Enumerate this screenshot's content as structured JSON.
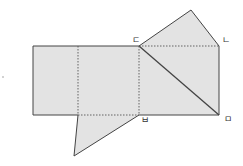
{
  "diagram": {
    "title": "",
    "colors": {
      "fill": "#e3e3e3",
      "stroke": "#444444",
      "dash": "#555555",
      "label": "#333333",
      "background": "#ffffff"
    },
    "labels": {
      "d": "ㄷ",
      "n": "ㄴ",
      "b": "ㅂ",
      "m": "ㅁ"
    },
    "shapes": {
      "rectangle": {
        "x1": 33,
        "y1": 46,
        "x2": 219,
        "y2": 115
      },
      "fold_lines_vertical_x": [
        78,
        139
      ],
      "top_triangle": [
        [
          139,
          46
        ],
        [
          191,
          10
        ],
        [
          219,
          46
        ]
      ],
      "bottom_triangle": [
        [
          78,
          115
        ],
        [
          139,
          115
        ],
        [
          74,
          156
        ]
      ],
      "diagonal": [
        [
          139,
          46
        ],
        [
          219,
          115
        ]
      ]
    }
  }
}
